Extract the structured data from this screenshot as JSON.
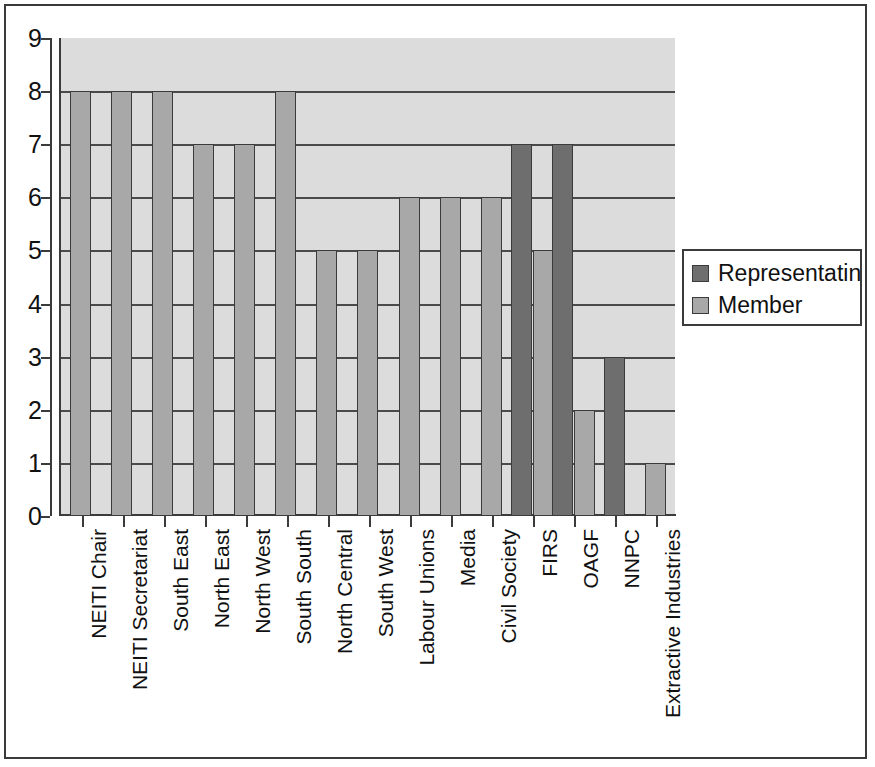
{
  "chart_data": {
    "type": "bar",
    "title": "",
    "subtitle": "",
    "xlabel": "",
    "ylabel": "",
    "ylim": [
      0,
      9
    ],
    "yticks": [
      0,
      1,
      2,
      3,
      4,
      5,
      6,
      7,
      8,
      9
    ],
    "grid": true,
    "orientation": "vertical",
    "grouping": "grouped",
    "legend_position": "right",
    "categories": [
      "NEITI Chair",
      "NEITI Secretariat",
      "South East",
      "North East",
      "North West",
      "South South",
      "North Central",
      "South West",
      "Labour Unions",
      "Media",
      "Civil Society",
      "FIRS",
      "OAGF",
      "NNPC",
      "Extractive Industries"
    ],
    "series": [
      {
        "name": "Representatinve",
        "color": "#6e6e6e",
        "values": [
          0,
          0,
          0,
          0,
          0,
          0,
          0,
          0,
          0,
          0,
          0,
          7,
          7,
          3,
          0
        ]
      },
      {
        "name": "Member",
        "color": "#a8a8a8",
        "values": [
          8,
          8,
          8,
          7,
          7,
          8,
          5,
          5,
          6,
          6,
          6,
          5,
          2,
          0,
          1
        ]
      }
    ]
  },
  "legend": {
    "entries": [
      {
        "label": "Representatinve",
        "swatch": "legend-swatch-representative"
      },
      {
        "label": "Member",
        "swatch": "legend-swatch-member"
      }
    ]
  },
  "axes": {
    "y_tick_labels": [
      "9",
      "8",
      "7",
      "6",
      "5",
      "4",
      "3",
      "2",
      "1",
      "0"
    ],
    "x_tick_labels": [
      "NEITI Chair",
      "NEITI Secretariat",
      "South East",
      "North East",
      "North West",
      "South South",
      "North Central",
      "South West",
      "Labour Unions",
      "Media",
      "Civil Society",
      "FIRS",
      "OAGF",
      "NNPC",
      "Extractive Industries"
    ]
  },
  "colors": {
    "representative": "#6e6e6e",
    "member": "#a8a8a8",
    "plot_background": "#dcdcdc",
    "gridline": "#4a4a4a",
    "axis": "#3b3b3b",
    "page_background": "#ffffff",
    "border": "#3a3a3a"
  }
}
